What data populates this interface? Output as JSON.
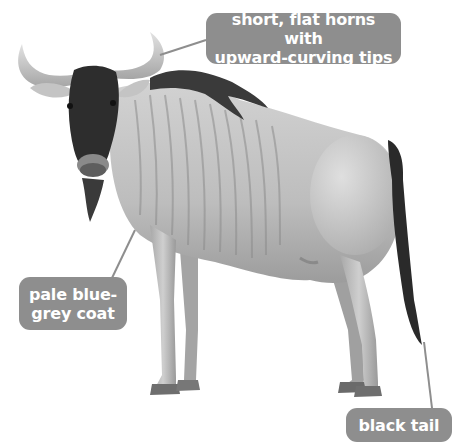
{
  "diagram": {
    "labels": [
      {
        "id": "horns",
        "lines": [
          "short, flat horns with",
          "upward-curving tips"
        ]
      },
      {
        "id": "coat",
        "lines": [
          "pale blue-",
          "grey coat"
        ]
      },
      {
        "id": "tail",
        "lines": [
          "black tail"
        ]
      }
    ],
    "colors": {
      "label_bg": "#8e8e8e",
      "label_text": "#ffffff",
      "leader_line": "#8e8e8e",
      "background": "#ffffff"
    }
  }
}
